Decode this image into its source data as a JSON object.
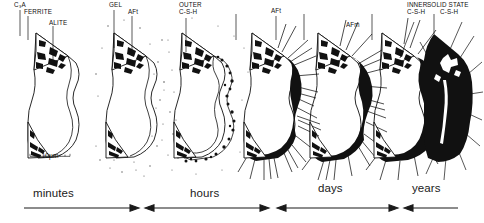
{
  "figure": {
    "scale_bar": {
      "label": "10µm",
      "name": "scale-bar"
    },
    "ink_color": "#111111",
    "background_color": "#ffffff"
  },
  "panels": [
    {
      "index": 1,
      "stage": "unhydrated grain",
      "labels": [
        {
          "text": "C₃A",
          "name": "label-c3a"
        },
        {
          "text": "FERRITE",
          "name": "label-ferrite"
        },
        {
          "text": "ALITE",
          "name": "label-alite"
        }
      ]
    },
    {
      "index": 2,
      "stage": "gel and early ettringite",
      "labels": [
        {
          "text": "GEL",
          "name": "label-gel"
        },
        {
          "text": "AFt",
          "name": "label-aft-early"
        }
      ]
    },
    {
      "index": 3,
      "stage": "outer C-S-H forming",
      "labels": [
        {
          "text": "OUTER",
          "name": "label-outer-csh-line1"
        },
        {
          "text": "C-S-H",
          "name": "label-outer-csh-line2"
        }
      ]
    },
    {
      "index": 4,
      "stage": "ettringite needles",
      "labels": [
        {
          "text": "AFt",
          "name": "label-aft"
        }
      ]
    },
    {
      "index": 5,
      "stage": "AFm conversion",
      "labels": [
        {
          "text": "AFm",
          "name": "label-afm"
        }
      ]
    },
    {
      "index": 6,
      "stage": "inner C-S-H",
      "labels": [
        {
          "text": "INNER",
          "name": "label-inner-csh-line1"
        },
        {
          "text": "C-S-H",
          "name": "label-inner-csh-line2"
        }
      ]
    },
    {
      "index": 7,
      "stage": "solid state C-S-H",
      "labels": [
        {
          "text": "SOLID STATE",
          "name": "label-solid-state-csh-line1"
        },
        {
          "text": "C-S-H",
          "name": "label-solid-state-csh-line2"
        }
      ]
    }
  ],
  "timeline": {
    "name": "time-axis",
    "segments": [
      {
        "label": "minutes",
        "arrows": "right"
      },
      {
        "label": "hours",
        "arrows": "both"
      },
      {
        "label": "days",
        "arrows": "both"
      },
      {
        "label": "years",
        "arrows": "left"
      }
    ]
  }
}
